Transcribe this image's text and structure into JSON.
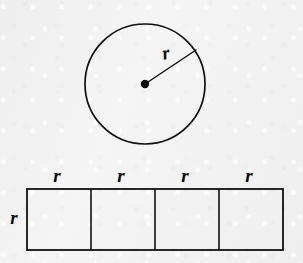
{
  "figure": {
    "background_color": "#f1f1f1",
    "stroke_color": "#111111",
    "label_color": "#0d0d0d",
    "circle": {
      "name": "circle-shape",
      "center_x": 145,
      "center_y": 84,
      "radius": 60,
      "stroke_width": 1.7,
      "center_dot_radius": 4.2,
      "radius_line": {
        "name": "radius-segment",
        "from_x": 145,
        "from_y": 84,
        "to_x": 196,
        "to_y": 50,
        "stroke_width": 1.5
      },
      "radius_label": {
        "text": "r",
        "x": 167,
        "y": 59,
        "font_size": 19,
        "rotation": -12
      }
    },
    "rectangle": {
      "name": "four-square-strip",
      "left": 27,
      "top": 189,
      "right": 283,
      "bottom": 250,
      "cell_count": 4,
      "cell_width": 64,
      "cell_height": 61,
      "stroke_width": 1.8,
      "divider_x": [
        91,
        155,
        219
      ],
      "top_labels": [
        {
          "text": "r",
          "x": 57,
          "y": 182,
          "font_size": 19
        },
        {
          "text": "r",
          "x": 121,
          "y": 182,
          "font_size": 19
        },
        {
          "text": "r",
          "x": 185,
          "y": 182,
          "font_size": 19
        },
        {
          "text": "r",
          "x": 249,
          "y": 182,
          "font_size": 19
        }
      ],
      "side_label": {
        "text": "r",
        "x": 14,
        "y": 224,
        "font_size": 19
      }
    }
  }
}
